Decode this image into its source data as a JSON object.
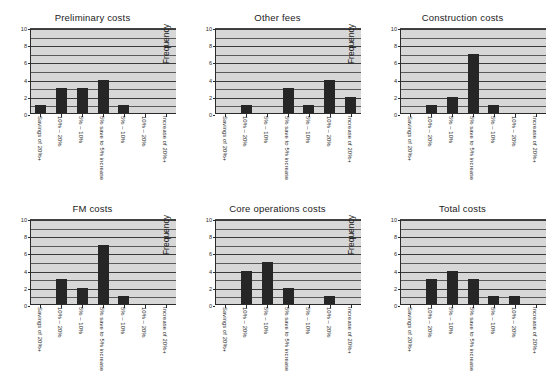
{
  "figure": {
    "background": "#ffffff",
    "bar_color": "#262626",
    "plot_background": "#d7d7d7",
    "gridline_color": "#5a5a5a",
    "axis_color": "#2b2b2b"
  },
  "chart_data": [
    {
      "type": "bar",
      "title": "Preliminary costs",
      "xlabel": "",
      "ylabel": "Frequency",
      "categories": [
        "Savings of 20%+",
        "10% – 20%",
        "5% – 10%",
        "5% save to 5% increase",
        "5% – 10%",
        "10% – 20%",
        "Increase of 20%+"
      ],
      "values": [
        1,
        3,
        3,
        4,
        1,
        0,
        0
      ],
      "ylim": [
        0,
        10
      ],
      "yticks": [
        0,
        2,
        4,
        6,
        8,
        10
      ],
      "grid": true,
      "legend": null
    },
    {
      "type": "bar",
      "title": "Other fees",
      "xlabel": "",
      "ylabel": "Frequency",
      "categories": [
        "Savings of 20%+",
        "10% – 20%",
        "5% – 10%",
        "5% save to 5% increase",
        "5% – 10%",
        "10% – 20%",
        "Increase of 20%+"
      ],
      "values": [
        0,
        1,
        0,
        3,
        1,
        4,
        2
      ],
      "ylim": [
        0,
        10
      ],
      "yticks": [
        0,
        2,
        4,
        6,
        8,
        10
      ],
      "grid": true,
      "legend": null
    },
    {
      "type": "bar",
      "title": "Construction costs",
      "xlabel": "",
      "ylabel": "Frequency",
      "categories": [
        "Savings of 20%+",
        "10% – 20%",
        "5% – 10%",
        "5% save to 5% increase",
        "5% – 10%",
        "10% – 20%",
        "Increase of 20%+"
      ],
      "values": [
        0,
        1,
        2,
        7,
        1,
        0,
        0
      ],
      "ylim": [
        0,
        10
      ],
      "yticks": [
        0,
        2,
        4,
        6,
        8,
        10
      ],
      "grid": true,
      "legend": null
    },
    {
      "type": "bar",
      "title": "FM costs",
      "xlabel": "",
      "ylabel": "Frequency",
      "categories": [
        "Savings of 20%+",
        "10% – 20%",
        "5% – 10%",
        "5% save to 5% increase",
        "5% – 10%",
        "10% – 20%",
        "Increase of 20%+"
      ],
      "values": [
        0,
        3,
        2,
        7,
        1,
        0,
        0
      ],
      "ylim": [
        0,
        10
      ],
      "yticks": [
        0,
        2,
        4,
        6,
        8,
        10
      ],
      "grid": true,
      "legend": null
    },
    {
      "type": "bar",
      "title": "Core operations costs",
      "xlabel": "",
      "ylabel": "Frequency",
      "categories": [
        "Savings of 20%+",
        "10% – 20%",
        "5% – 10%",
        "5% save to 5% increase",
        "5% – 10%",
        "10% – 20%",
        "Increase of 20%+"
      ],
      "values": [
        0,
        4,
        5,
        2,
        0,
        1,
        0
      ],
      "ylim": [
        0,
        10
      ],
      "yticks": [
        0,
        2,
        4,
        6,
        8,
        10
      ],
      "grid": true,
      "legend": null
    },
    {
      "type": "bar",
      "title": "Total costs",
      "xlabel": "",
      "ylabel": "Frequency",
      "categories": [
        "Savings of 20%+",
        "10% – 20%",
        "5% – 10%",
        "5% save to 5% increase",
        "5% – 10%",
        "10% – 20%",
        "Increase of 20%+"
      ],
      "values": [
        0,
        3,
        4,
        3,
        1,
        1,
        0
      ],
      "ylim": [
        0,
        10
      ],
      "yticks": [
        0,
        2,
        4,
        6,
        8,
        10
      ],
      "grid": true,
      "legend": null
    }
  ]
}
